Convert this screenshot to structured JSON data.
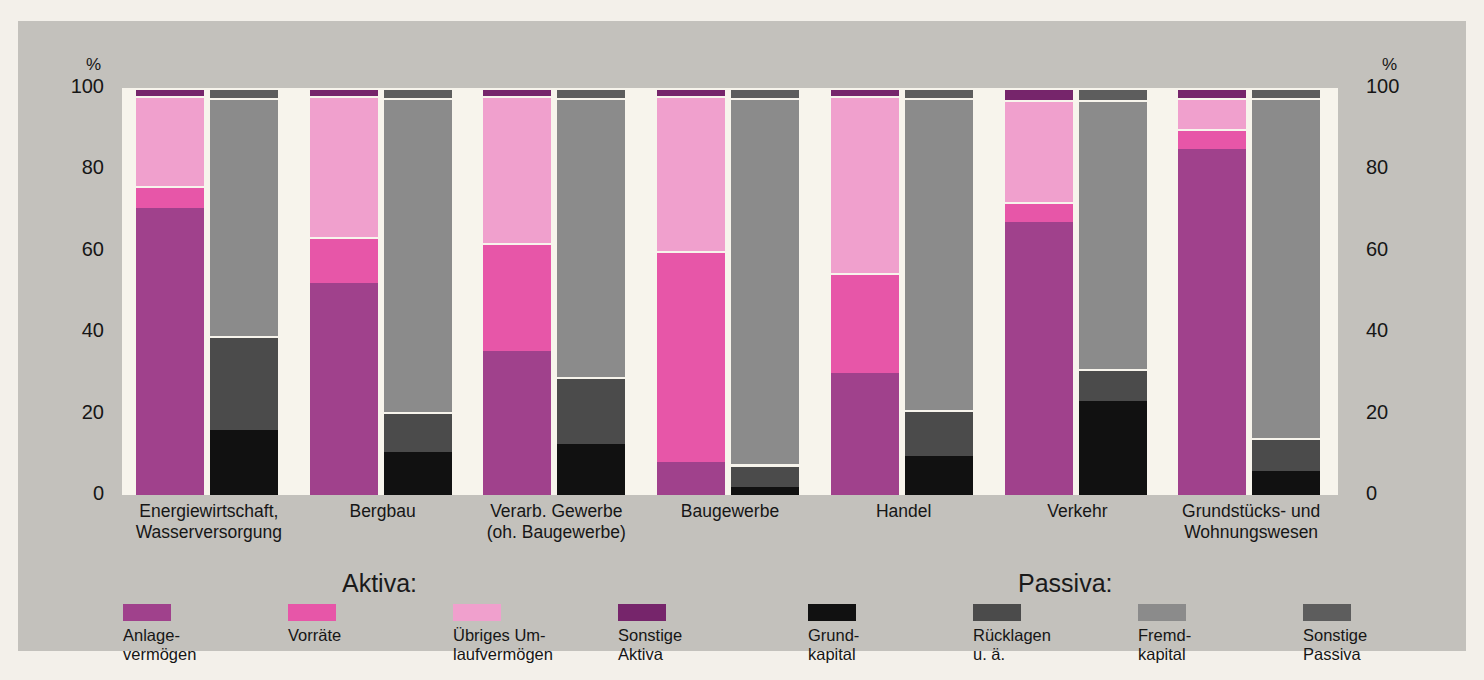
{
  "axis": {
    "unit": "%",
    "ticks": [
      100,
      80,
      60,
      40,
      20,
      0
    ],
    "tick_labels": [
      "100",
      "80",
      "60",
      "40",
      "20",
      "0"
    ]
  },
  "legend": {
    "aktiva_title": "Aktiva:",
    "passiva_title": "Passiva:",
    "aktiva_items": [
      {
        "label": "Anlage-\nvermögen",
        "color": "#a0418c"
      },
      {
        "label": "Vorräte",
        "color": "#e756a8"
      },
      {
        "label": "Übriges Um-\nlaufvermögen",
        "color": "#f0a0cd"
      },
      {
        "label": "Sonstige\nAktiva",
        "color": "#76256b"
      }
    ],
    "passiva_items": [
      {
        "label": "Grund-\nkapital",
        "color": "#111111"
      },
      {
        "label": "Rücklagen\nu. ä.",
        "color": "#4b4b4b"
      },
      {
        "label": "Fremd-\nkapital",
        "color": "#8b8b8b"
      },
      {
        "label": "Sonstige\nPassiva",
        "color": "#5d5d5d"
      }
    ]
  },
  "chart_data": {
    "type": "bar",
    "title": "",
    "xlabel": "",
    "ylabel": "%",
    "ylim": [
      0,
      100
    ],
    "grid": false,
    "stacked": true,
    "legend_position": "bottom",
    "categories": [
      "Energiewirtschaft,\nWasserversorgung",
      "Bergbau",
      "Verarb. Gewerbe\n(oh. Baugewerbe)",
      "Baugewerbe",
      "Handel",
      "Verkehr",
      "Grundstücks- und\nWohnungswesen"
    ],
    "groups": [
      {
        "name": "Energiewirtschaft, Wasserversorgung",
        "aktiva": [
          {
            "name": "Anlagevermögen",
            "value": 70.5,
            "color": "#a0418c"
          },
          {
            "name": "Vorräte",
            "value": 5.5,
            "color": "#e756a8"
          },
          {
            "name": "Übriges Umlaufvermögen",
            "value": 22.0,
            "color": "#f0a0cd"
          },
          {
            "name": "Sonstige Aktiva",
            "value": 2.0,
            "color": "#76256b"
          }
        ],
        "passiva": [
          {
            "name": "Grundkapital",
            "value": 16.0,
            "color": "#111111"
          },
          {
            "name": "Rücklagen u. ä.",
            "value": 23.0,
            "color": "#4b4b4b"
          },
          {
            "name": "Fremdkapital",
            "value": 58.5,
            "color": "#8b8b8b"
          },
          {
            "name": "Sonstige Passiva",
            "value": 2.5,
            "color": "#5d5d5d"
          }
        ]
      },
      {
        "name": "Bergbau",
        "aktiva": [
          {
            "name": "Anlagevermögen",
            "value": 52.0,
            "color": "#a0418c"
          },
          {
            "name": "Vorräte",
            "value": 11.5,
            "color": "#e756a8"
          },
          {
            "name": "Übriges Umlaufvermögen",
            "value": 34.5,
            "color": "#f0a0cd"
          },
          {
            "name": "Sonstige Aktiva",
            "value": 2.0,
            "color": "#76256b"
          }
        ],
        "passiva": [
          {
            "name": "Grundkapital",
            "value": 10.5,
            "color": "#111111"
          },
          {
            "name": "Rücklagen u. ä.",
            "value": 10.0,
            "color": "#4b4b4b"
          },
          {
            "name": "Fremdkapital",
            "value": 77.0,
            "color": "#8b8b8b"
          },
          {
            "name": "Sonstige Passiva",
            "value": 2.5,
            "color": "#5d5d5d"
          }
        ]
      },
      {
        "name": "Verarb. Gewerbe (oh. Baugewerbe)",
        "aktiva": [
          {
            "name": "Anlagevermögen",
            "value": 35.5,
            "color": "#a0418c"
          },
          {
            "name": "Vorräte",
            "value": 26.5,
            "color": "#e756a8"
          },
          {
            "name": "Übriges Umlaufvermögen",
            "value": 36.0,
            "color": "#f0a0cd"
          },
          {
            "name": "Sonstige Aktiva",
            "value": 2.0,
            "color": "#76256b"
          }
        ],
        "passiva": [
          {
            "name": "Grundkapital",
            "value": 12.5,
            "color": "#111111"
          },
          {
            "name": "Rücklagen u. ä.",
            "value": 16.5,
            "color": "#4b4b4b"
          },
          {
            "name": "Fremdkapital",
            "value": 68.5,
            "color": "#8b8b8b"
          },
          {
            "name": "Sonstige Passiva",
            "value": 2.5,
            "color": "#5d5d5d"
          }
        ]
      },
      {
        "name": "Baugewerbe",
        "aktiva": [
          {
            "name": "Anlagevermögen",
            "value": 8.0,
            "color": "#a0418c"
          },
          {
            "name": "Vorräte",
            "value": 52.0,
            "color": "#e756a8"
          },
          {
            "name": "Übriges Umlaufvermögen",
            "value": 38.0,
            "color": "#f0a0cd"
          },
          {
            "name": "Sonstige Aktiva",
            "value": 2.0,
            "color": "#76256b"
          }
        ],
        "passiva": [
          {
            "name": "Grundkapital",
            "value": 2.0,
            "color": "#111111"
          },
          {
            "name": "Rücklagen u. ä.",
            "value": 5.5,
            "color": "#4b4b4b"
          },
          {
            "name": "Fremdkapital",
            "value": 90.0,
            "color": "#8b8b8b"
          },
          {
            "name": "Sonstige Passiva",
            "value": 2.5,
            "color": "#5d5d5d"
          }
        ]
      },
      {
        "name": "Handel",
        "aktiva": [
          {
            "name": "Anlagevermögen",
            "value": 30.0,
            "color": "#a0418c"
          },
          {
            "name": "Vorräte",
            "value": 24.5,
            "color": "#e756a8"
          },
          {
            "name": "Übriges Umlaufvermögen",
            "value": 43.5,
            "color": "#f0a0cd"
          },
          {
            "name": "Sonstige Aktiva",
            "value": 2.0,
            "color": "#76256b"
          }
        ],
        "passiva": [
          {
            "name": "Grundkapital",
            "value": 9.5,
            "color": "#111111"
          },
          {
            "name": "Rücklagen u. ä.",
            "value": 11.5,
            "color": "#4b4b4b"
          },
          {
            "name": "Fremdkapital",
            "value": 76.5,
            "color": "#8b8b8b"
          },
          {
            "name": "Sonstige Passiva",
            "value": 2.5,
            "color": "#5d5d5d"
          }
        ]
      },
      {
        "name": "Verkehr",
        "aktiva": [
          {
            "name": "Anlagevermögen",
            "value": 67.0,
            "color": "#a0418c"
          },
          {
            "name": "Vorräte",
            "value": 5.0,
            "color": "#e756a8"
          },
          {
            "name": "Übriges Umlaufvermögen",
            "value": 25.0,
            "color": "#f0a0cd"
          },
          {
            "name": "Sonstige Aktiva",
            "value": 3.0,
            "color": "#76256b"
          }
        ],
        "passiva": [
          {
            "name": "Grundkapital",
            "value": 23.0,
            "color": "#111111"
          },
          {
            "name": "Rücklagen u. ä.",
            "value": 8.0,
            "color": "#4b4b4b"
          },
          {
            "name": "Fremdkapital",
            "value": 66.0,
            "color": "#8b8b8b"
          },
          {
            "name": "Sonstige Passiva",
            "value": 3.0,
            "color": "#5d5d5d"
          }
        ]
      },
      {
        "name": "Grundstücks- und Wohnungswesen",
        "aktiva": [
          {
            "name": "Anlagevermögen",
            "value": 85.0,
            "color": "#a0418c"
          },
          {
            "name": "Vorräte",
            "value": 5.0,
            "color": "#e756a8"
          },
          {
            "name": "Übriges Umlaufvermögen",
            "value": 7.5,
            "color": "#f0a0cd"
          },
          {
            "name": "Sonstige Aktiva",
            "value": 2.5,
            "color": "#76256b"
          }
        ],
        "passiva": [
          {
            "name": "Grundkapital",
            "value": 6.0,
            "color": "#111111"
          },
          {
            "name": "Rücklagen u. ä.",
            "value": 8.0,
            "color": "#4b4b4b"
          },
          {
            "name": "Fremdkapital",
            "value": 83.5,
            "color": "#8b8b8b"
          },
          {
            "name": "Sonstige Passiva",
            "value": 2.5,
            "color": "#5d5d5d"
          }
        ]
      }
    ]
  }
}
